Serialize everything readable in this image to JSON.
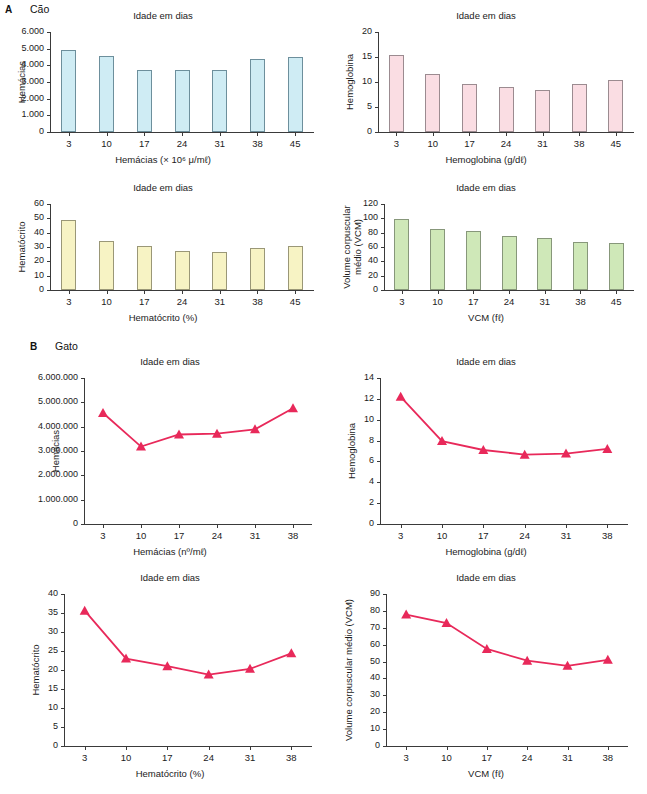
{
  "panels": [
    {
      "letter": "A",
      "species": "Cão",
      "charts": [
        {
          "title": "Idade em dias",
          "ylabel": "Hemácias",
          "xlabel": "Hemácias (× 10⁶ μ/mℓ)",
          "yticks": [
            "6.000",
            "5.000",
            "4.000",
            "3.000",
            "2.000",
            "1.000",
            "0"
          ],
          "xticks": [
            "3",
            "10",
            "17",
            "24",
            "31",
            "38",
            "45"
          ],
          "fill": "#cfecf4",
          "stroke": "#6d8f9c"
        },
        {
          "title": "Idade em dias",
          "ylabel": "Hemoglobina",
          "xlabel": "Hemoglobina (g/dℓ)",
          "yticks": [
            "20",
            "15",
            "10",
            "5",
            "0"
          ],
          "xticks": [
            "3",
            "10",
            "17",
            "24",
            "31",
            "38",
            "45"
          ],
          "fill": "#fadde3",
          "stroke": "#9b8b90"
        },
        {
          "title": "Idade em dias",
          "ylabel": "Hematócrito",
          "xlabel": "Hematócrito (%)",
          "yticks": [
            "60",
            "50",
            "40",
            "30",
            "20",
            "10",
            "0"
          ],
          "xticks": [
            "3",
            "10",
            "17",
            "24",
            "31",
            "38",
            "45"
          ],
          "fill": "#f7f3c4",
          "stroke": "#9a9777"
        },
        {
          "title": "Idade em dias",
          "ylabel": "Volume corpuscular médio (VCM)",
          "xlabel": "VCM (fℓ)",
          "yticks": [
            "120",
            "100",
            "80",
            "60",
            "40",
            "20",
            "0"
          ],
          "xticks": [
            "3",
            "10",
            "17",
            "24",
            "31",
            "38",
            "45"
          ],
          "fill": "#cfe8b8",
          "stroke": "#87977a"
        }
      ]
    },
    {
      "letter": "B",
      "species": "Gato",
      "charts": [
        {
          "title": "Idade em dias",
          "ylabel": "Hemácias",
          "xlabel": "Hemácias (nº/mℓ)",
          "yticks": [
            "6.000.000",
            "5.000.000",
            "4.000.000",
            "3.000.000",
            "2.000.000",
            "1.000.000",
            "0"
          ],
          "xticks": [
            "3",
            "10",
            "17",
            "24",
            "31",
            "38"
          ],
          "stroke": "#e8295a"
        },
        {
          "title": "Idade em dias",
          "ylabel": "Hemoglobina",
          "xlabel": "Hemoglobina (g/dℓ)",
          "yticks": [
            "14",
            "12",
            "10",
            "8",
            "6",
            "4",
            "2",
            "0"
          ],
          "xticks": [
            "3",
            "10",
            "17",
            "24",
            "31",
            "38"
          ],
          "stroke": "#e8295a"
        },
        {
          "title": "Idade em dias",
          "ylabel": "Hematócrito",
          "xlabel": "Hematócrito (%)",
          "yticks": [
            "40",
            "35",
            "30",
            "25",
            "20",
            "15",
            "10",
            "5",
            "0"
          ],
          "xticks": [
            "3",
            "10",
            "17",
            "24",
            "31",
            "38"
          ],
          "stroke": "#e8295a"
        },
        {
          "title": "Idade em dias",
          "ylabel": "Volume corpuscular médio (VCM)",
          "xlabel": "VCM (fℓ)",
          "yticks": [
            "90",
            "80",
            "70",
            "60",
            "50",
            "40",
            "30",
            "20",
            "10",
            "0"
          ],
          "xticks": [
            "3",
            "10",
            "17",
            "24",
            "31",
            "38"
          ],
          "stroke": "#e8295a"
        }
      ]
    }
  ],
  "chart_data": [
    {
      "id": "dog-rbc",
      "type": "bar",
      "title": "Idade em dias",
      "panel": "A",
      "species": "Cão",
      "xlabel": "Hemácias (× 10⁶ μ/mℓ)",
      "ylabel": "Hemácias",
      "categories": [
        "3",
        "10",
        "17",
        "24",
        "31",
        "38",
        "45"
      ],
      "values": [
        4950,
        4550,
        3700,
        3700,
        3700,
        4400,
        4500
      ],
      "ylim": [
        0,
        6000
      ],
      "ytick_values": [
        0,
        1000,
        2000,
        3000,
        4000,
        5000,
        6000
      ],
      "grid": false,
      "legend": "none"
    },
    {
      "id": "dog-hgb",
      "type": "bar",
      "title": "Idade em dias",
      "panel": "A",
      "species": "Cão",
      "xlabel": "Hemoglobina (g/dℓ)",
      "ylabel": "Hemoglobina",
      "categories": [
        "3",
        "10",
        "17",
        "24",
        "31",
        "38",
        "45"
      ],
      "values": [
        15.4,
        11.7,
        9.7,
        9.1,
        8.5,
        9.7,
        10.5
      ],
      "ylim": [
        0,
        20
      ],
      "ytick_values": [
        0,
        5,
        10,
        15,
        20
      ],
      "grid": false,
      "legend": "none"
    },
    {
      "id": "dog-hct",
      "type": "bar",
      "title": "Idade em dias",
      "panel": "A",
      "species": "Cão",
      "xlabel": "Hematócrito (%)",
      "ylabel": "Hematócrito",
      "categories": [
        "3",
        "10",
        "17",
        "24",
        "31",
        "38",
        "45"
      ],
      "values": [
        49,
        34.5,
        31,
        27.5,
        26.5,
        29.5,
        30.5
      ],
      "ylim": [
        0,
        60
      ],
      "ytick_values": [
        0,
        10,
        20,
        30,
        40,
        50,
        60
      ],
      "grid": false,
      "legend": "none"
    },
    {
      "id": "dog-vcm",
      "type": "bar",
      "title": "Idade em dias",
      "panel": "A",
      "species": "Cão",
      "xlabel": "VCM (fℓ)",
      "ylabel": "Volume corpuscular médio (VCM)",
      "categories": [
        "3",
        "10",
        "17",
        "24",
        "31",
        "38",
        "45"
      ],
      "values": [
        99.5,
        85.5,
        82,
        76,
        72,
        67.5,
        66
      ],
      "ylim": [
        0,
        120
      ],
      "ytick_values": [
        0,
        20,
        40,
        60,
        80,
        100,
        120
      ],
      "grid": false,
      "legend": "none"
    },
    {
      "id": "cat-rbc",
      "type": "line",
      "title": "Idade em dias",
      "panel": "B",
      "species": "Gato",
      "xlabel": "Hemácias (nº/mℓ)",
      "ylabel": "Hemácias",
      "categories": [
        "3",
        "10",
        "17",
        "24",
        "31",
        "38"
      ],
      "values": [
        4560000,
        3180000,
        3680000,
        3710000,
        3890000,
        4760000
      ],
      "ylim": [
        0,
        6000000
      ],
      "ytick_values": [
        0,
        1000000,
        2000000,
        3000000,
        4000000,
        5000000,
        6000000
      ],
      "marker": "triangle",
      "grid": false,
      "legend": "none"
    },
    {
      "id": "cat-hgb",
      "type": "line",
      "title": "Idade em dias",
      "panel": "B",
      "species": "Gato",
      "xlabel": "Hemoglobina (g/dℓ)",
      "ylabel": "Hemoglobina",
      "categories": [
        "3",
        "10",
        "17",
        "24",
        "31",
        "38"
      ],
      "values": [
        12.2,
        7.95,
        7.1,
        6.65,
        6.75,
        7.2
      ],
      "ylim": [
        0,
        14
      ],
      "ytick_values": [
        0,
        2,
        4,
        6,
        8,
        10,
        12,
        14
      ],
      "marker": "triangle",
      "grid": false,
      "legend": "none"
    },
    {
      "id": "cat-hct",
      "type": "line",
      "title": "Idade em dias",
      "panel": "B",
      "species": "Gato",
      "xlabel": "Hematócrito (%)",
      "ylabel": "Hematócrito",
      "categories": [
        "3",
        "10",
        "17",
        "24",
        "31",
        "38"
      ],
      "values": [
        35.6,
        23.0,
        21.0,
        18.8,
        20.3,
        24.4
      ],
      "ylim": [
        0,
        40
      ],
      "ytick_values": [
        0,
        5,
        10,
        15,
        20,
        25,
        30,
        35,
        40
      ],
      "marker": "triangle",
      "grid": false,
      "legend": "none"
    },
    {
      "id": "cat-vcm",
      "type": "line",
      "title": "Idade em dias",
      "panel": "B",
      "species": "Gato",
      "xlabel": "VCM (fℓ)",
      "ylabel": "Volume corpuscular médio (VCM)",
      "categories": [
        "3",
        "10",
        "17",
        "24",
        "31",
        "38"
      ],
      "values": [
        77.8,
        72.8,
        57.5,
        50.5,
        47.5,
        51.0
      ],
      "ylim": [
        0,
        90
      ],
      "ytick_values": [
        0,
        10,
        20,
        30,
        40,
        50,
        60,
        70,
        80,
        90
      ],
      "marker": "triangle",
      "grid": false,
      "legend": "none"
    }
  ]
}
